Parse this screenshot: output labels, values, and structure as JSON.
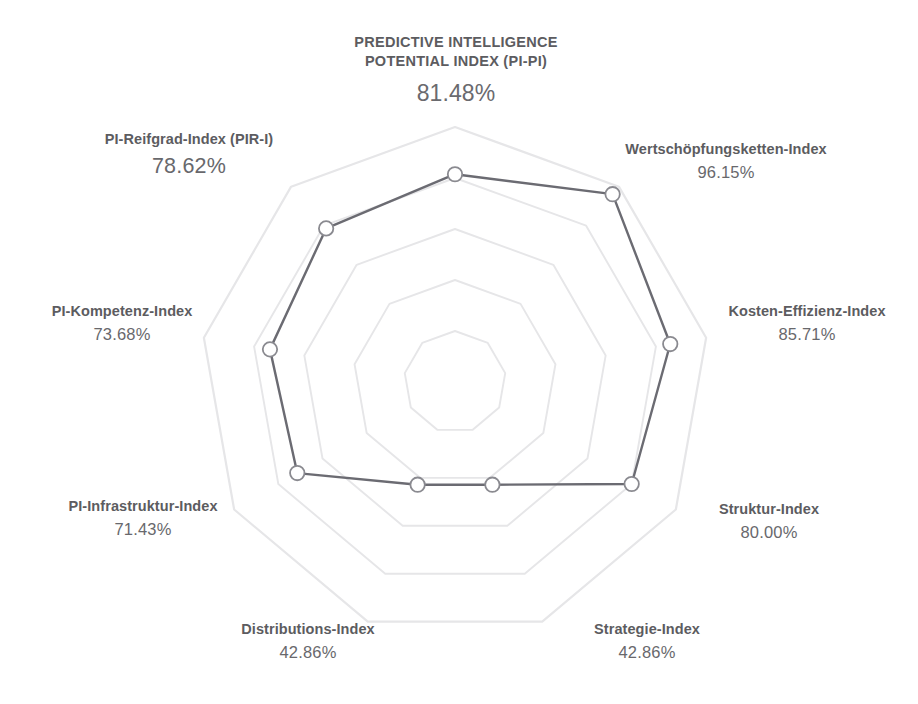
{
  "title": {
    "line1": "PREDICTIVE INTELLIGENCE",
    "line2": "POTENTIAL INDEX (PI-PI)",
    "value": "81.48%"
  },
  "caption": {
    "text": ""
  },
  "colors": {
    "grid": "#e6e6e8",
    "series_line": "#6b6b72",
    "marker_fill": "#ffffff",
    "marker_stroke": "#8a8a90",
    "label_text": "#5c5c60",
    "value_text": "#68686c",
    "background": "#ffffff"
  },
  "axes": [
    {
      "id": "wertschoepfungsketten",
      "label": "Wertschöpfungsketten-Index",
      "value_text": "96.15%"
    },
    {
      "id": "kosten-effizienz",
      "label": "Kosten-Effizienz-Index",
      "value_text": "85.71%"
    },
    {
      "id": "struktur",
      "label": "Struktur-Index",
      "value_text": "80.00%"
    },
    {
      "id": "strategie",
      "label": "Strategie-Index",
      "value_text": "42.86%"
    },
    {
      "id": "distributions",
      "label": "Distributions-Index",
      "value_text": "42.86%"
    },
    {
      "id": "pi-infrastruktur",
      "label": "PI-Infrastruktur-Index",
      "value_text": "71.43%"
    },
    {
      "id": "pi-kompetenz",
      "label": "PI-Kompetenz-Index",
      "value_text": "73.68%"
    },
    {
      "id": "pi-reifgrad",
      "label": "PI-Reifgrad-Index (PIR-I)",
      "value_text": "78.62%"
    }
  ],
  "chart_data": {
    "type": "radar",
    "title": "PREDICTIVE INTELLIGENCE POTENTIAL INDEX (PI-PI)",
    "center_value": 81.48,
    "unit": "%",
    "rings": 5,
    "grid": true,
    "legend": "none",
    "rlim": [
      0,
      100
    ],
    "categories": [
      "PREDICTIVE INTELLIGENCE POTENTIAL INDEX (PI-PI)",
      "Wertschöpfungsketten-Index",
      "Kosten-Effizienz-Index",
      "Struktur-Index",
      "Strategie-Index",
      "Distributions-Index",
      "PI-Infrastruktur-Index",
      "PI-Kompetenz-Index",
      "PI-Reifgrad-Index (PIR-I)"
    ],
    "values": [
      81.48,
      96.15,
      85.71,
      80.0,
      42.86,
      42.86,
      71.43,
      73.68,
      78.62
    ],
    "series": [
      {
        "name": "PI-PI",
        "values": [
          81.48,
          96.15,
          85.71,
          80.0,
          42.86,
          42.86,
          71.43,
          73.68,
          78.62
        ]
      }
    ]
  }
}
